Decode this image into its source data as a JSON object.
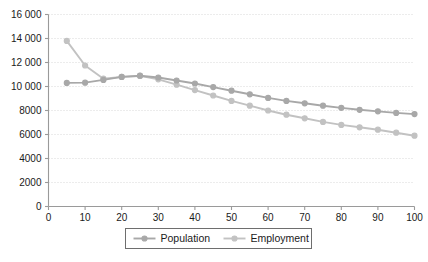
{
  "chart_data": {
    "type": "line",
    "title": "",
    "xlabel": "",
    "ylabel": "",
    "xlim": [
      0,
      100
    ],
    "ylim": [
      0,
      16000
    ],
    "grid": true,
    "legend_position": "bottom-center",
    "x": [
      5,
      10,
      15,
      20,
      25,
      30,
      35,
      40,
      45,
      50,
      55,
      60,
      65,
      70,
      75,
      80,
      85,
      90,
      95,
      100
    ],
    "xticks": [
      "0",
      "10",
      "20",
      "30",
      "40",
      "50",
      "60",
      "70",
      "80",
      "90",
      "100"
    ],
    "xtick_values": [
      0,
      10,
      20,
      30,
      40,
      50,
      60,
      70,
      80,
      90,
      100
    ],
    "yticks": [
      "0",
      "2000",
      "4000",
      "6000",
      "8000",
      "10 000",
      "12 000",
      "14 000",
      "16 000"
    ],
    "ytick_values": [
      0,
      2000,
      4000,
      6000,
      8000,
      10000,
      12000,
      14000,
      16000
    ],
    "series": [
      {
        "name": "Population",
        "color": "#a8a8a8",
        "marker": "circle",
        "values": [
          10300,
          10320,
          10550,
          10800,
          10900,
          10750,
          10500,
          10250,
          9950,
          9650,
          9350,
          9050,
          8800,
          8600,
          8400,
          8220,
          8060,
          7930,
          7800,
          7700
        ]
      },
      {
        "name": "Employment",
        "color": "#c2c2c2",
        "marker": "circle",
        "values": [
          13800,
          11750,
          10650,
          10800,
          10880,
          10600,
          10150,
          9700,
          9250,
          8800,
          8400,
          8000,
          7650,
          7350,
          7050,
          6800,
          6600,
          6400,
          6150,
          5900
        ]
      }
    ]
  },
  "legend": {
    "entries": [
      {
        "label": "Population"
      },
      {
        "label": "Employment"
      }
    ]
  }
}
